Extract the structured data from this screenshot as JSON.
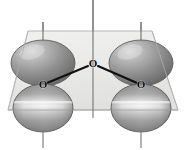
{
  "figure": {
    "background_color": "#ffffff",
    "width": 188,
    "height": 150
  },
  "plane": {
    "name": "molecular-plane",
    "fill_color": "#e9e9e7",
    "edge_color": "#b4b4b4",
    "opacity": 0.85,
    "corners": [
      {
        "x": 28,
        "y": 31
      },
      {
        "x": 152,
        "y": 31
      },
      {
        "x": 178,
        "y": 110
      },
      {
        "x": 8,
        "y": 110
      }
    ]
  },
  "atoms": [
    {
      "id": "atom-center",
      "label": "O",
      "x": 93,
      "y": 63,
      "role": "central-oxygen"
    },
    {
      "id": "atom-left",
      "label": "O",
      "x": 43,
      "y": 84,
      "role": "terminal-oxygen-left"
    },
    {
      "id": "atom-right",
      "label": "O",
      "x": 141,
      "y": 84,
      "role": "terminal-oxygen-right"
    }
  ],
  "bonds": [
    {
      "id": "bond-center-left",
      "from": "atom-center",
      "to": "atom-left",
      "color": "#101010",
      "width": 2.1
    },
    {
      "id": "bond-center-right",
      "from": "atom-center",
      "to": "atom-right",
      "color": "#101010",
      "width": 2.1
    }
  ],
  "axes": [
    {
      "id": "axis-left",
      "x": 43,
      "y1": 22,
      "y2": 148,
      "color": "#7a7a7a"
    },
    {
      "id": "axis-center",
      "x": 93,
      "y1": 0,
      "y2": 118,
      "color": "#7a7a7a"
    },
    {
      "id": "axis-right",
      "x": 141,
      "y1": 22,
      "y2": 148,
      "color": "#7a7a7a"
    }
  ],
  "orbital_lobes": [
    {
      "id": "lobe-left-upper",
      "atom": "atom-left",
      "position": "upper",
      "cx": 43,
      "cy": 63,
      "rx": 32,
      "ry": 23,
      "fill_dark": "#6f6f6f",
      "fill_mid": "#9a9a9a",
      "fill_light": "#d2d2d2",
      "edge_color": "#5a5a5a"
    },
    {
      "id": "lobe-left-lower",
      "atom": "atom-left",
      "position": "lower",
      "cx": 43,
      "cy": 108,
      "rx": 30,
      "ry": 24,
      "fill_dark": "#7b7b7b",
      "fill_mid": "#aeaeae",
      "fill_light": "#f0f0f0",
      "edge_color": "#5a5a5a"
    },
    {
      "id": "lobe-right-upper",
      "atom": "atom-right",
      "position": "upper",
      "cx": 141,
      "cy": 63,
      "rx": 32,
      "ry": 23,
      "fill_dark": "#6f6f6f",
      "fill_mid": "#9a9a9a",
      "fill_light": "#d2d2d2",
      "edge_color": "#5a5a5a"
    },
    {
      "id": "lobe-right-lower",
      "atom": "atom-right",
      "position": "lower",
      "cx": 141,
      "cy": 108,
      "rx": 30,
      "ry": 24,
      "fill_dark": "#7b7b7b",
      "fill_mid": "#aeaeae",
      "fill_light": "#f0f0f0",
      "edge_color": "#5a5a5a"
    }
  ]
}
